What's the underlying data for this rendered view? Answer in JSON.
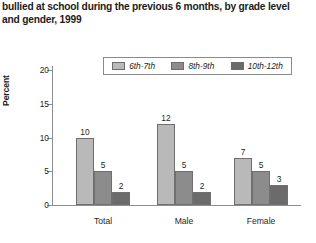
{
  "title": {
    "line1": "bullied at school during the previous 6 months, by grade level",
    "line2": "and gender, 1999"
  },
  "legend": {
    "items": [
      {
        "label": "6th-7th",
        "color": "#b9b9b9"
      },
      {
        "label": "8th-9th",
        "color": "#8c8c8c"
      },
      {
        "label": "10th-12th",
        "color": "#6b6b6b"
      }
    ]
  },
  "axes": {
    "ylabel": "Percent",
    "yticks": [
      "0",
      "5",
      "10",
      "15",
      "20"
    ],
    "ymin": 0,
    "ymax": 20
  },
  "chart_data": {
    "type": "bar",
    "title": "bullied at school during the previous 6 months, by grade level and gender, 1999",
    "xlabel": "",
    "ylabel": "Percent",
    "ylim": [
      0,
      20
    ],
    "yticks": [
      0,
      5,
      10,
      15,
      20
    ],
    "grid": false,
    "legend_position": "top-center",
    "categories": [
      "Total",
      "Male",
      "Female"
    ],
    "series": [
      {
        "name": "6th-7th",
        "color": "#b9b9b9",
        "values": [
          10,
          12,
          7
        ]
      },
      {
        "name": "8th-9th",
        "color": "#8c8c8c",
        "values": [
          5,
          5,
          5
        ]
      },
      {
        "name": "10th-12th",
        "color": "#6b6b6b",
        "values": [
          2,
          2,
          3
        ]
      }
    ],
    "data_labels": [
      {
        "category": "Total",
        "series": "6th-7th",
        "value": 10
      },
      {
        "category": "Total",
        "series": "8th-9th",
        "value": 5
      },
      {
        "category": "Total",
        "series": "10th-12th",
        "value": 2
      },
      {
        "category": "Male",
        "series": "6th-7th",
        "value": 12
      },
      {
        "category": "Male",
        "series": "8th-9th",
        "value": 5
      },
      {
        "category": "Male",
        "series": "10th-12th",
        "value": 2
      },
      {
        "category": "Female",
        "series": "6th-7th",
        "value": 7
      },
      {
        "category": "Female",
        "series": "8th-9th",
        "value": 5
      },
      {
        "category": "Female",
        "series": "10th-12th",
        "value": 3
      }
    ]
  }
}
